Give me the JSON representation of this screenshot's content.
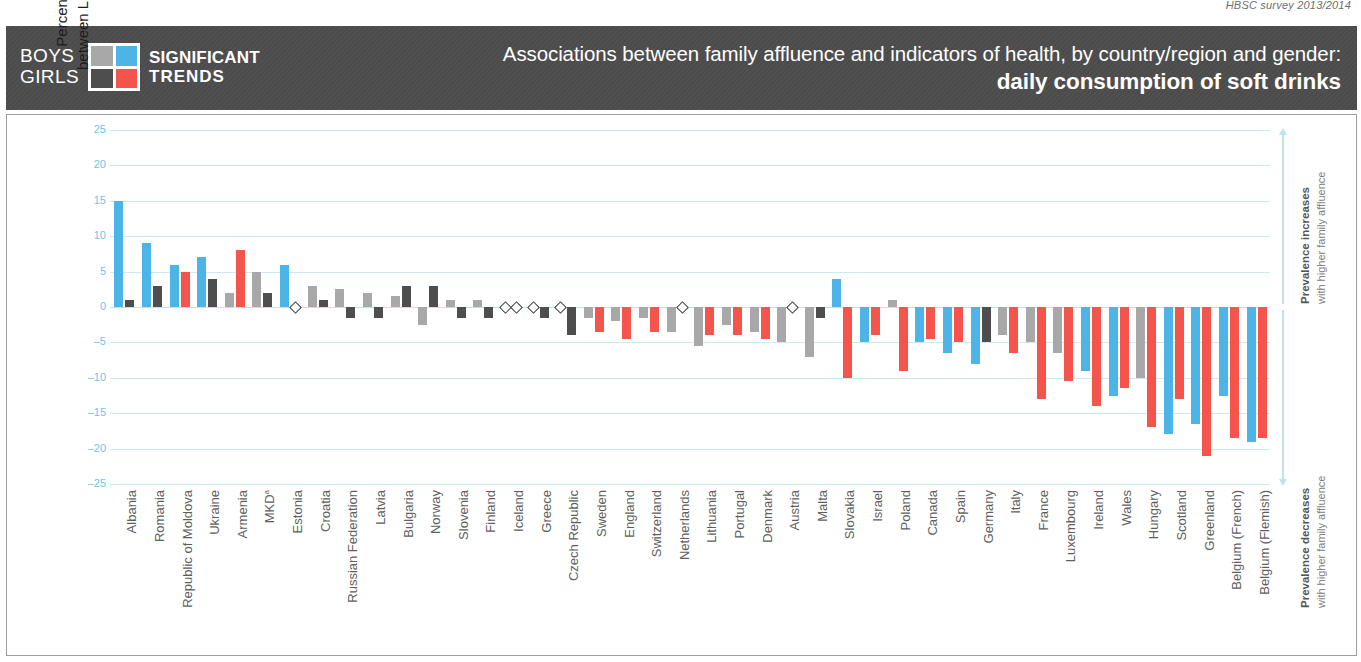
{
  "source_note": "HBSC survey 2013/2014",
  "header": {
    "legend": {
      "row1_label": "BOYS",
      "row2_label": "GIRLS",
      "trend_line1": "SIGNIFICANT",
      "trend_line2": "TRENDS",
      "swatches": [
        {
          "name": "boys-nonsignificant",
          "color": "#a8a8a8"
        },
        {
          "name": "boys-significant",
          "color": "#4cb4e7"
        },
        {
          "name": "girls-nonsignificant",
          "color": "#4e4e4e"
        },
        {
          "name": "girls-significant",
          "color": "#f4544c"
        }
      ]
    },
    "title_line1": "Associations between family affluence and indicators of health, by country/region and gender:",
    "title_line2": "daily consumption of soft drinks"
  },
  "axis": {
    "y_caption_line1": "Percentage-point difference in prevalence",
    "y_caption_line2": "between LOW and HIGH family affluence groups"
  },
  "annotations": {
    "up_bold": "Prevalence increases",
    "up_rest": "with higher family affluence",
    "down_bold": "Prevalence decreases",
    "down_rest": "with higher family affluence"
  },
  "colors": {
    "boys_significant": "#4cb4e7",
    "boys_nonsignificant": "#a8a8a8",
    "girls_significant": "#f4544c",
    "girls_nonsignificant": "#4e4e4e",
    "gridline": "#cfe9f3",
    "tick_text": "#6fc4e8",
    "header_band": "#4a4a4a"
  },
  "chart_data": {
    "type": "bar",
    "title": "Associations between family affluence and indicators of health, by country/region and gender: daily consumption of soft drinks",
    "xlabel": "",
    "ylabel": "Percentage-point difference in prevalence between LOW and HIGH family affluence groups",
    "ylim": [
      -25,
      25
    ],
    "yticks": [
      25,
      20,
      15,
      10,
      5,
      0,
      -5,
      -10,
      -15,
      -20,
      -25
    ],
    "grid": true,
    "legend_position": "header-left",
    "series": [
      {
        "name": "Boys",
        "significant_color": "#4cb4e7",
        "nonsignificant_color": "#a8a8a8"
      },
      {
        "name": "Girls",
        "significant_color": "#f4544c",
        "nonsignificant_color": "#4e4e4e"
      }
    ],
    "categories": [
      "Albania",
      "Romania",
      "Republic of Moldova",
      "Ukraine",
      "Armenia",
      "MKD",
      "Estonia",
      "Croatia",
      "Russian Federation",
      "Latvia",
      "Bulgaria",
      "Norway",
      "Slovenia",
      "Finland",
      "Iceland",
      "Greece",
      "Czech Republic",
      "Sweden",
      "England",
      "Switzerland",
      "Netherlands",
      "Lithuania",
      "Portugal",
      "Denmark",
      "Austria",
      "Malta",
      "Slovakia",
      "Israel",
      "Poland",
      "Canada",
      "Spain",
      "Germany",
      "Italy",
      "France",
      "Luxembourg",
      "Ireland",
      "Wales",
      "Hungary",
      "Scotland",
      "Greenland",
      "Belgium (French)",
      "Belgium (Flemish)"
    ],
    "category_labels": [
      "Albania",
      "Romania",
      "Republic of Moldova",
      "Ukraine",
      "Armenia",
      "MKDᵃ",
      "Estonia",
      "Croatia",
      "Russian Federation",
      "Latvia",
      "Bulgaria",
      "Norway",
      "Slovenia",
      "Finland",
      "Iceland",
      "Greece",
      "Czech Republic",
      "Sweden",
      "England",
      "Switzerland",
      "Netherlands",
      "Lithuania",
      "Portugal",
      "Denmark",
      "Austria",
      "Malta",
      "Slovakia",
      "Israel",
      "Poland",
      "Canada",
      "Spain",
      "Germany",
      "Italy",
      "France",
      "Luxembourg",
      "Ireland",
      "Wales",
      "Hungary",
      "Scotland",
      "Greenland",
      "Belgium (French)",
      "Belgium (Flemish)"
    ],
    "bars": [
      {
        "category": "Albania",
        "boys": 15.0,
        "boys_sig": true,
        "girls": 1.0,
        "girls_sig": false,
        "girls_dark": true
      },
      {
        "category": "Romania",
        "boys": 9.0,
        "boys_sig": true,
        "girls": 3.0,
        "girls_sig": false,
        "girls_dark": true
      },
      {
        "category": "Republic of Moldova",
        "boys": 6.0,
        "boys_sig": true,
        "girls": 5.0,
        "girls_sig": true,
        "girls_dark": false
      },
      {
        "category": "Ukraine",
        "boys": 7.0,
        "boys_sig": true,
        "girls": 4.0,
        "girls_sig": false,
        "girls_dark": true
      },
      {
        "category": "Armenia",
        "boys": 2.0,
        "boys_sig": false,
        "girls": 8.0,
        "girls_sig": true,
        "girls_dark": false
      },
      {
        "category": "MKD",
        "boys": 5.0,
        "boys_sig": false,
        "girls": 2.0,
        "girls_sig": false,
        "girls_dark": true
      },
      {
        "category": "Estonia",
        "boys": 6.0,
        "boys_sig": true,
        "girls": null,
        "girls_sig": false,
        "girls_dark": true
      },
      {
        "category": "Croatia",
        "boys": 3.0,
        "boys_sig": false,
        "girls": 1.0,
        "girls_sig": false,
        "girls_dark": true
      },
      {
        "category": "Russian Federation",
        "boys": 2.5,
        "boys_sig": false,
        "girls": -1.5,
        "girls_sig": false,
        "girls_dark": true
      },
      {
        "category": "Latvia",
        "boys": 2.0,
        "boys_sig": false,
        "girls": -1.5,
        "girls_sig": false,
        "girls_dark": true
      },
      {
        "category": "Bulgaria",
        "boys": 1.5,
        "boys_sig": false,
        "girls": 3.0,
        "girls_sig": false,
        "girls_dark": true
      },
      {
        "category": "Norway",
        "boys": -2.5,
        "boys_sig": false,
        "girls": 3.0,
        "girls_sig": false,
        "girls_dark": true
      },
      {
        "category": "Slovenia",
        "boys": 1.0,
        "boys_sig": false,
        "girls": -1.5,
        "girls_sig": false,
        "girls_dark": true
      },
      {
        "category": "Finland",
        "boys": 1.0,
        "boys_sig": false,
        "girls": -1.5,
        "girls_sig": false,
        "girls_dark": true
      },
      {
        "category": "Iceland",
        "boys": null,
        "boys_sig": false,
        "girls": null,
        "girls_sig": false,
        "girls_dark": true
      },
      {
        "category": "Greece",
        "boys": null,
        "boys_sig": false,
        "girls": -1.5,
        "girls_sig": false,
        "girls_dark": true
      },
      {
        "category": "Czech Republic",
        "boys": null,
        "boys_sig": false,
        "girls": -4.0,
        "girls_sig": false,
        "girls_dark": true
      },
      {
        "category": "Sweden",
        "boys": -1.5,
        "boys_sig": false,
        "girls": -3.5,
        "girls_sig": true,
        "girls_dark": false
      },
      {
        "category": "England",
        "boys": -2.0,
        "boys_sig": false,
        "girls": -4.5,
        "girls_sig": true,
        "girls_dark": false
      },
      {
        "category": "Switzerland",
        "boys": -1.5,
        "boys_sig": false,
        "girls": -3.5,
        "girls_sig": true,
        "girls_dark": false
      },
      {
        "category": "Netherlands",
        "boys": -3.5,
        "boys_sig": false,
        "girls": null,
        "girls_sig": false,
        "girls_dark": true
      },
      {
        "category": "Lithuania",
        "boys": -5.5,
        "boys_sig": false,
        "girls": -4.0,
        "girls_sig": true,
        "girls_dark": false
      },
      {
        "category": "Portugal",
        "boys": -2.5,
        "boys_sig": false,
        "girls": -4.0,
        "girls_sig": true,
        "girls_dark": false
      },
      {
        "category": "Denmark",
        "boys": -3.5,
        "boys_sig": false,
        "girls": -4.5,
        "girls_sig": true,
        "girls_dark": false
      },
      {
        "category": "Austria",
        "boys": -5.0,
        "boys_sig": false,
        "girls": null,
        "girls_sig": false,
        "girls_dark": true
      },
      {
        "category": "Malta",
        "boys": -7.0,
        "boys_sig": false,
        "girls": -1.5,
        "girls_sig": false,
        "girls_dark": true
      },
      {
        "category": "Slovakia",
        "boys": 4.0,
        "boys_sig": true,
        "girls": -10.0,
        "girls_sig": true,
        "girls_dark": false
      },
      {
        "category": "Israel",
        "boys": -5.0,
        "boys_sig": true,
        "girls": -4.0,
        "girls_sig": true,
        "girls_dark": false
      },
      {
        "category": "Poland",
        "boys": 1.0,
        "boys_sig": false,
        "girls": -9.0,
        "girls_sig": true,
        "girls_dark": false
      },
      {
        "category": "Canada",
        "boys": -5.0,
        "boys_sig": true,
        "girls": -4.5,
        "girls_sig": true,
        "girls_dark": false
      },
      {
        "category": "Spain",
        "boys": -6.5,
        "boys_sig": true,
        "girls": -5.0,
        "girls_sig": true,
        "girls_dark": false
      },
      {
        "category": "Germany",
        "boys": -8.0,
        "boys_sig": true,
        "girls": -5.0,
        "girls_sig": false,
        "girls_dark": true
      },
      {
        "category": "Italy",
        "boys": -4.0,
        "boys_sig": false,
        "girls": -6.5,
        "girls_sig": true,
        "girls_dark": false
      },
      {
        "category": "France",
        "boys": -5.0,
        "boys_sig": false,
        "girls": -13.0,
        "girls_sig": true,
        "girls_dark": false
      },
      {
        "category": "Luxembourg",
        "boys": -6.5,
        "boys_sig": false,
        "girls": -10.5,
        "girls_sig": true,
        "girls_dark": false
      },
      {
        "category": "Ireland",
        "boys": -9.0,
        "boys_sig": true,
        "girls": -14.0,
        "girls_sig": true,
        "girls_dark": false
      },
      {
        "category": "Wales",
        "boys": -12.5,
        "boys_sig": true,
        "girls": -11.5,
        "girls_sig": true,
        "girls_dark": false
      },
      {
        "category": "Hungary",
        "boys": -10.0,
        "boys_sig": false,
        "girls": -17.0,
        "girls_sig": true,
        "girls_dark": false
      },
      {
        "category": "Scotland",
        "boys": -18.0,
        "boys_sig": true,
        "girls": -13.0,
        "girls_sig": true,
        "girls_dark": false
      },
      {
        "category": "Greenland",
        "boys": -16.5,
        "boys_sig": true,
        "girls": -21.0,
        "girls_sig": true,
        "girls_dark": false
      },
      {
        "category": "Belgium (French)",
        "boys": -12.5,
        "boys_sig": true,
        "girls": -18.5,
        "girls_sig": true,
        "girls_dark": false
      },
      {
        "category": "Belgium (Flemish)",
        "boys": -19.0,
        "boys_sig": true,
        "girls": -18.5,
        "girls_sig": true,
        "girls_dark": false
      }
    ]
  }
}
